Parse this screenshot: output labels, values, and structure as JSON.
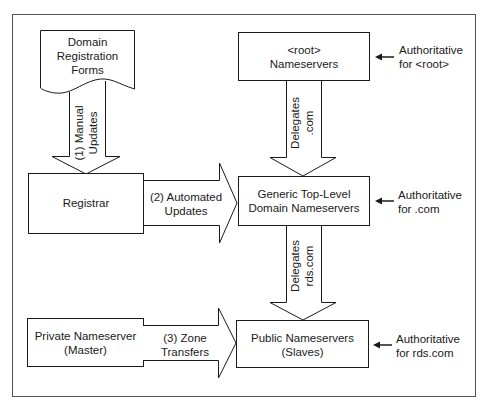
{
  "diagram": {
    "nodes": {
      "forms": {
        "label_line1": "Domain",
        "label_line2": "Registration",
        "label_line3": "Forms"
      },
      "registrar": {
        "label": "Registrar"
      },
      "private_ns": {
        "label_line1": "Private Nameserver",
        "label_line2": "(Master)"
      },
      "root_ns": {
        "label_line1": "<root>",
        "label_line2": "Nameservers"
      },
      "gtld_ns": {
        "label_line1": "Generic Top-Level",
        "label_line2": "Domain Nameservers"
      },
      "public_ns": {
        "label_line1": "Public Nameservers",
        "label_line2": "(Slaves)"
      }
    },
    "arrows": {
      "manual": {
        "line1": "(1) Manual",
        "line2": "Updates"
      },
      "automated": {
        "line1": "(2) Automated",
        "line2": "Updates"
      },
      "zone": {
        "line1": "(3) Zone",
        "line2": "Transfers"
      },
      "delegates_com": {
        "line1": "Delegates",
        "line2": ".com"
      },
      "delegates_rds": {
        "line1": "Delegates",
        "line2": "rds.com"
      }
    },
    "annotations": {
      "root": {
        "line1": "Authoritative",
        "line2": "for <root>"
      },
      "com": {
        "line1": "Authoritative",
        "line2": "for .com"
      },
      "rds": {
        "line1": "Authoritative",
        "line2": "for rds.com"
      }
    },
    "colors": {
      "stroke": "#1a1a1a",
      "frame": "#555555",
      "fill": "#ffffff"
    }
  }
}
